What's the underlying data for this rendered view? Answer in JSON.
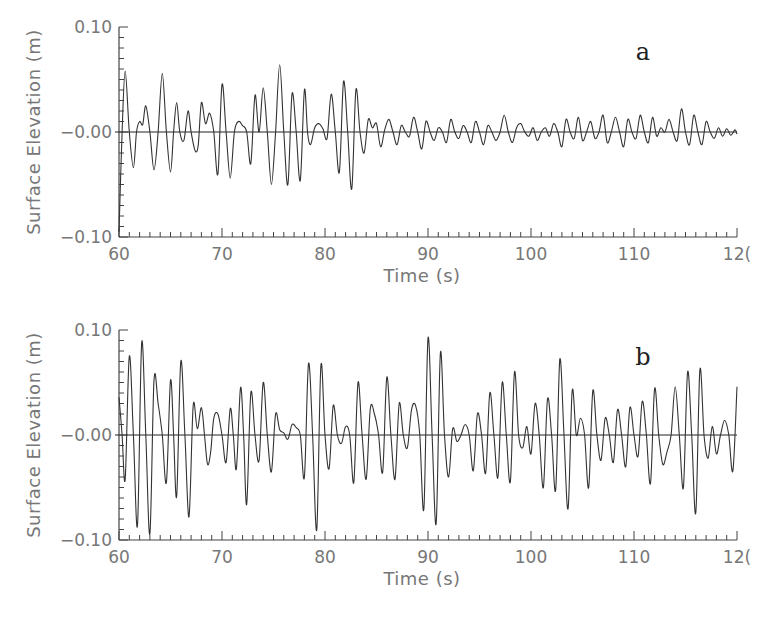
{
  "chart_data": [
    {
      "type": "line",
      "panel_label": "a",
      "title": "",
      "xlabel": "Time (s)",
      "ylabel": "Surface Elevation (m)",
      "xlim": [
        60,
        120
      ],
      "ylim": [
        -0.1,
        0.1
      ],
      "x_ticks": [
        "60",
        "70",
        "80",
        "90",
        "100",
        "110",
        "120"
      ],
      "y_ticks": [
        "0.10",
        "-0.00",
        "-0.10"
      ],
      "grid": false,
      "legend": null,
      "series": [
        {
          "name": "surface elevation a",
          "x": [
            60.0,
            60.3,
            60.6,
            61.0,
            61.4,
            61.7,
            62.0,
            62.3,
            62.6,
            63.0,
            63.4,
            63.8,
            64.2,
            64.6,
            65.0,
            65.3,
            65.6,
            65.9,
            66.3,
            66.7,
            67.0,
            67.4,
            67.7,
            68.0,
            68.4,
            68.8,
            69.2,
            69.6,
            70.0,
            70.4,
            70.8,
            71.2,
            71.6,
            72.0,
            72.4,
            72.8,
            73.2,
            73.6,
            74.0,
            74.4,
            74.8,
            75.2,
            75.6,
            76.0,
            76.4,
            76.8,
            77.2,
            77.6,
            78.0,
            78.3,
            78.6,
            79.0,
            79.4,
            79.8,
            80.2,
            80.6,
            81.0,
            81.4,
            81.8,
            82.2,
            82.6,
            83.0,
            83.4,
            83.8,
            84.2,
            84.6,
            85.0,
            85.4,
            85.8,
            86.2,
            86.6,
            87.0,
            87.4,
            87.8,
            88.2,
            88.6,
            89.0,
            89.4,
            89.8,
            90.2,
            90.6,
            91.0,
            91.4,
            91.8,
            92.2,
            92.6,
            93.0,
            93.4,
            93.8,
            94.2,
            94.6,
            95.0,
            95.4,
            95.8,
            96.2,
            96.6,
            97.0,
            97.4,
            97.8,
            98.2,
            98.6,
            99.0,
            99.4,
            99.8,
            100.2,
            100.6,
            101.0,
            101.4,
            101.8,
            102.2,
            102.6,
            103.0,
            103.4,
            103.8,
            104.2,
            104.6,
            105.0,
            105.4,
            105.8,
            106.2,
            106.6,
            107.0,
            107.4,
            107.8,
            108.2,
            108.6,
            109.0,
            109.4,
            109.8,
            110.2,
            110.6,
            111.0,
            111.4,
            111.8,
            112.2,
            112.6,
            113.0,
            113.4,
            113.8,
            114.2,
            114.6,
            115.0,
            115.4,
            115.8,
            116.2,
            116.6,
            117.0,
            117.4,
            117.8,
            118.2,
            118.6,
            119.0,
            119.4,
            119.8,
            120.0
          ],
          "y": [
            -0.095,
            0.0,
            0.058,
            0.0,
            -0.034,
            0.0,
            0.01,
            0.007,
            0.025,
            0.0,
            -0.036,
            0.0,
            0.056,
            0.0,
            -0.038,
            0.0,
            0.028,
            0.0,
            -0.008,
            0.02,
            0.0,
            -0.018,
            -0.012,
            0.028,
            0.008,
            0.018,
            0.0,
            -0.04,
            0.045,
            0.0,
            -0.044,
            0.0,
            0.01,
            0.006,
            0.0,
            -0.03,
            0.035,
            0.0,
            0.042,
            0.0,
            -0.05,
            0.0,
            0.064,
            0.0,
            -0.05,
            0.036,
            0.0,
            -0.046,
            0.04,
            0.0,
            -0.012,
            0.004,
            0.008,
            0.003,
            -0.006,
            0.036,
            0.0,
            -0.038,
            0.048,
            0.0,
            -0.054,
            0.04,
            0.0,
            -0.02,
            0.012,
            0.004,
            0.008,
            -0.014,
            0.002,
            0.012,
            0.0,
            -0.012,
            0.006,
            0.0,
            -0.004,
            0.014,
            0.0,
            -0.016,
            0.01,
            0.0,
            -0.008,
            0.004,
            0.0,
            -0.01,
            0.012,
            0.0,
            -0.006,
            0.006,
            0.0,
            -0.01,
            0.01,
            0.0,
            -0.012,
            0.006,
            0.0,
            -0.008,
            0.0,
            0.016,
            0.0,
            -0.01,
            0.004,
            0.008,
            0.0,
            -0.004,
            0.004,
            -0.008,
            0.0,
            0.004,
            -0.004,
            0.008,
            0.0,
            -0.014,
            0.012,
            0.0,
            -0.006,
            0.014,
            -0.008,
            0.0,
            0.01,
            -0.006,
            0.0,
            0.016,
            -0.01,
            0.0,
            0.014,
            0.0,
            -0.014,
            0.012,
            0.0,
            -0.006,
            0.016,
            0.0,
            -0.01,
            0.014,
            -0.004,
            0.004,
            0.0,
            0.012,
            0.0,
            -0.008,
            0.022,
            0.0,
            -0.012,
            0.016,
            0.0,
            -0.012,
            0.01,
            0.0,
            -0.006,
            0.004,
            -0.004,
            0.003,
            -0.003,
            0.002,
            -0.002,
            0.002,
            0.001
          ]
        }
      ]
    },
    {
      "type": "line",
      "panel_label": "b",
      "title": "",
      "xlabel": "Time (s)",
      "ylabel": "Surface Elevation (m)",
      "xlim": [
        60,
        120
      ],
      "ylim": [
        -0.1,
        0.1
      ],
      "x_ticks": [
        "60",
        "70",
        "80",
        "90",
        "100",
        "110",
        "120"
      ],
      "y_ticks": [
        "0.10",
        "-0.00",
        "-0.10"
      ],
      "grid": false,
      "legend": null,
      "series": [
        {
          "name": "surface elevation b",
          "x": [
            60.0,
            60.3,
            60.6,
            61.0,
            61.4,
            61.8,
            62.2,
            62.6,
            63.0,
            63.4,
            63.8,
            64.2,
            64.6,
            65.0,
            65.3,
            65.6,
            66.0,
            66.4,
            66.8,
            67.2,
            67.6,
            68.0,
            68.3,
            68.6,
            68.9,
            69.2,
            69.6,
            70.0,
            70.4,
            70.8,
            71.1,
            71.4,
            71.8,
            72.1,
            72.4,
            72.8,
            73.2,
            73.6,
            74.0,
            74.4,
            74.8,
            75.2,
            75.6,
            76.0,
            76.4,
            76.8,
            77.2,
            77.6,
            78.0,
            78.4,
            78.8,
            79.2,
            79.6,
            80.0,
            80.4,
            80.8,
            81.2,
            81.6,
            82.0,
            82.4,
            82.8,
            83.2,
            83.6,
            84.0,
            84.4,
            84.8,
            85.2,
            85.6,
            86.0,
            86.4,
            86.8,
            87.2,
            87.6,
            88.0,
            88.4,
            88.8,
            89.2,
            89.6,
            90.0,
            90.4,
            90.8,
            91.2,
            91.6,
            92.0,
            92.4,
            92.8,
            93.2,
            93.6,
            94.0,
            94.4,
            94.8,
            95.2,
            95.6,
            96.0,
            96.4,
            96.8,
            97.2,
            97.6,
            98.0,
            98.4,
            98.8,
            99.2,
            99.6,
            100.0,
            100.4,
            100.8,
            101.2,
            101.6,
            102.0,
            102.4,
            102.8,
            103.2,
            103.6,
            104.0,
            104.4,
            104.8,
            105.2,
            105.6,
            106.0,
            106.4,
            106.8,
            107.2,
            107.6,
            108.0,
            108.4,
            108.8,
            109.2,
            109.6,
            110.0,
            110.4,
            110.8,
            111.2,
            111.6,
            112.0,
            112.4,
            112.8,
            113.2,
            113.6,
            114.0,
            114.4,
            114.8,
            115.2,
            115.6,
            116.0,
            116.4,
            116.8,
            117.2,
            117.6,
            118.0,
            118.4,
            118.8,
            119.2,
            119.6,
            120.0
          ],
          "y": [
            0.036,
            0.0,
            -0.042,
            0.075,
            0.0,
            -0.086,
            0.088,
            0.0,
            -0.094,
            0.052,
            0.03,
            0.0,
            -0.045,
            0.052,
            0.0,
            -0.058,
            0.07,
            0.0,
            -0.078,
            0.028,
            0.006,
            0.026,
            0.0,
            -0.028,
            -0.016,
            0.016,
            0.02,
            0.0,
            -0.026,
            0.025,
            0.0,
            -0.032,
            0.045,
            0.0,
            -0.066,
            0.04,
            0.0,
            -0.024,
            0.05,
            0.0,
            -0.035,
            0.02,
            0.005,
            0.002,
            -0.004,
            0.01,
            0.007,
            0.0,
            -0.04,
            0.068,
            0.0,
            -0.09,
            0.066,
            0.0,
            -0.032,
            0.028,
            0.0,
            -0.008,
            0.008,
            0.0,
            -0.045,
            0.05,
            0.0,
            -0.042,
            0.025,
            0.02,
            0.0,
            -0.035,
            0.055,
            0.0,
            -0.042,
            0.03,
            0.0,
            -0.012,
            0.024,
            0.028,
            0.0,
            -0.07,
            0.092,
            0.0,
            -0.084,
            0.078,
            0.0,
            -0.04,
            0.006,
            -0.006,
            0.0,
            0.01,
            0.0,
            -0.034,
            0.02,
            0.0,
            -0.036,
            0.04,
            0.0,
            -0.04,
            0.05,
            0.0,
            -0.044,
            0.06,
            0.0,
            -0.012,
            0.008,
            -0.018,
            0.03,
            0.0,
            -0.05,
            0.034,
            0.0,
            -0.052,
            0.072,
            0.0,
            -0.07,
            0.042,
            0.0,
            0.016,
            0.0,
            -0.05,
            0.042,
            0.0,
            -0.024,
            0.016,
            0.0,
            -0.026,
            0.024,
            0.0,
            -0.03,
            0.026,
            0.0,
            -0.02,
            0.032,
            0.0,
            -0.046,
            0.044,
            0.0,
            -0.028,
            -0.016,
            0.0,
            0.046,
            0.0,
            -0.05,
            0.06,
            0.0,
            -0.074,
            0.062,
            0.0,
            -0.022,
            0.008,
            -0.018,
            0.0,
            0.014,
            0.0,
            -0.034,
            0.046,
            0.0,
            -0.048,
            0.028
          ]
        }
      ]
    }
  ],
  "panels": [
    {
      "letter": "a",
      "ylabel": "Surface Elevation (m)",
      "xlabel": "Time (s)",
      "y_tick_labels": [
        "0.10",
        "−0.00",
        "−0.10"
      ],
      "x_tick_labels": [
        "60",
        "70",
        "80",
        "90",
        "100",
        "110",
        "12("
      ]
    },
    {
      "letter": "b",
      "ylabel": "Surface Elevation (m)",
      "xlabel": "Time (s)",
      "y_tick_labels": [
        "0.10",
        "−0.00",
        "−0.10"
      ],
      "x_tick_labels": [
        "60",
        "70",
        "80",
        "90",
        "100",
        "110",
        "12("
      ]
    }
  ],
  "style": {
    "line_color": "#333333",
    "axis_color": "#444444",
    "label_color": "#777777"
  }
}
